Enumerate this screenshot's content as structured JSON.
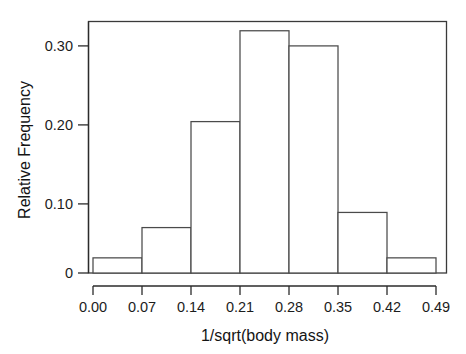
{
  "chart_data": {
    "type": "bar",
    "title": "",
    "subtitle": "",
    "xlabel": "1/sqrt(body mass)",
    "ylabel": "Relative Frequency",
    "categories": [
      "0.00-0.07",
      "0.07-0.14",
      "0.14-0.21",
      "0.21-0.28",
      "0.28-0.35",
      "0.35-0.42",
      "0.42-0.49"
    ],
    "bin_edges": [
      0.0,
      0.07,
      0.14,
      0.21,
      0.28,
      0.35,
      0.42,
      0.49
    ],
    "values": [
      0.02,
      0.06,
      0.2,
      0.32,
      0.3,
      0.08,
      0.02
    ],
    "bin_width": 0.07,
    "xlim": [
      0.0,
      0.49
    ],
    "ylim": [
      0,
      0.335
    ],
    "xticks": [
      0.0,
      0.07,
      0.14,
      0.21,
      0.28,
      0.35,
      0.42,
      0.49
    ],
    "xticklabels": [
      "0.00",
      "0.07",
      "0.14",
      "0.21",
      "0.28",
      "0.35",
      "0.42",
      "0.49"
    ],
    "yticks": [
      0,
      0.1,
      0.2,
      0.3
    ],
    "yticklabels": [
      "0",
      "0.10",
      "0.20",
      "0.30"
    ],
    "grid": false,
    "legend": null,
    "legend_position": "none",
    "bar_fill_color": "#ffffff",
    "bar_edge_color": "#4a4a4a",
    "axis_color": "#2b2b2b",
    "background_color": "#ffffff"
  },
  "axes": {
    "x_title": "1/sqrt(body mass)",
    "y_title": "Relative Frequency"
  },
  "x_tick_labels": [
    {
      "label": "0.00"
    },
    {
      "label": "0.07"
    },
    {
      "label": "0.14"
    },
    {
      "label": "0.21"
    },
    {
      "label": "0.28"
    },
    {
      "label": "0.35"
    },
    {
      "label": "0.42"
    },
    {
      "label": "0.49"
    }
  ],
  "y_tick_labels": [
    {
      "label": "0"
    },
    {
      "label": "0.10"
    },
    {
      "label": "0.20"
    },
    {
      "label": "0.30"
    }
  ]
}
